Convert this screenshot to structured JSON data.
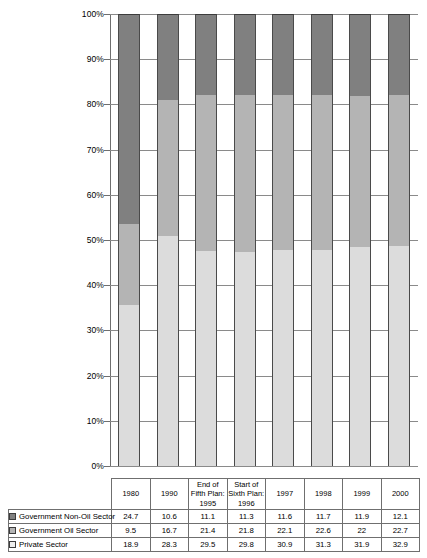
{
  "chart_data": {
    "type": "bar",
    "stacked": true,
    "stack_mode": "percent",
    "title": "",
    "xlabel": "",
    "ylabel": "",
    "ylim": [
      0,
      100
    ],
    "ytick_labels": [
      "0%",
      "10%",
      "20%",
      "30%",
      "40%",
      "50%",
      "60%",
      "70%",
      "80%",
      "90%",
      "100%"
    ],
    "ytick_values": [
      0,
      10,
      20,
      30,
      40,
      50,
      60,
      70,
      80,
      90,
      100
    ],
    "grid": true,
    "legend_position": "table-left",
    "categories": [
      "1980",
      "1990",
      "End of Fifth Plan: 1995",
      "Start of Sixth Plan: 1996",
      "1997",
      "1998",
      "1999",
      "2000"
    ],
    "series": [
      {
        "name": "Government Non-Oil Sector",
        "color": "#808080",
        "values": [
          24.7,
          10.6,
          11.1,
          11.3,
          11.6,
          11.7,
          11.9,
          12.1
        ]
      },
      {
        "name": "Government Oil Sector",
        "color": "#b4b4b4",
        "values": [
          9.5,
          16.7,
          21.4,
          21.8,
          22.1,
          22.6,
          22,
          22.7
        ]
      },
      {
        "name": "Private Sector",
        "color": "#dcdcdc",
        "values": [
          18.9,
          28.3,
          29.5,
          29.8,
          30.9,
          31.3,
          31.9,
          32.9
        ]
      }
    ]
  }
}
